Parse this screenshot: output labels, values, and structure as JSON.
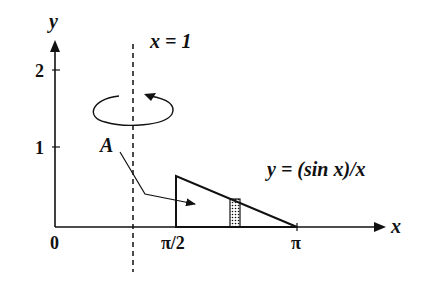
{
  "axes": {
    "x_label": "x",
    "y_label": "y",
    "origin_label": "0",
    "x_ticks": [
      "π/2",
      "π"
    ],
    "y_ticks": [
      "1",
      "2"
    ]
  },
  "axis_of_rotation": {
    "label": "x = 1"
  },
  "region": {
    "label": "A"
  },
  "curve": {
    "label": "y = (sin x)/x"
  },
  "colors": {
    "ink": "#111111",
    "background": "#ffffff"
  }
}
